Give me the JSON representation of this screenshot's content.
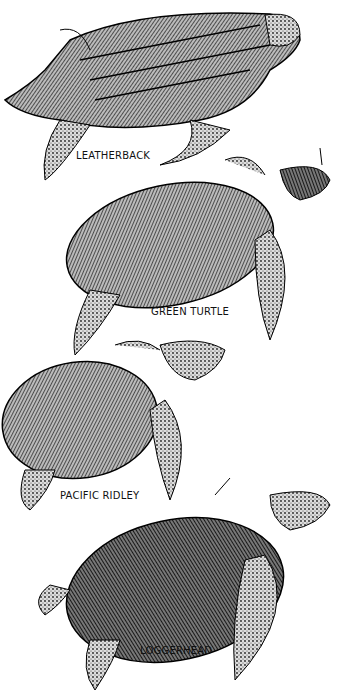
{
  "illustration": {
    "style": "black-and-white stipple engraving of sea turtles",
    "turtles": [
      {
        "name": "LEATHERBACK"
      },
      {
        "name": "GREEN TURTLE"
      },
      {
        "name": "PACIFIC RIDLEY"
      },
      {
        "name": "LOGGERHEAD"
      }
    ]
  }
}
